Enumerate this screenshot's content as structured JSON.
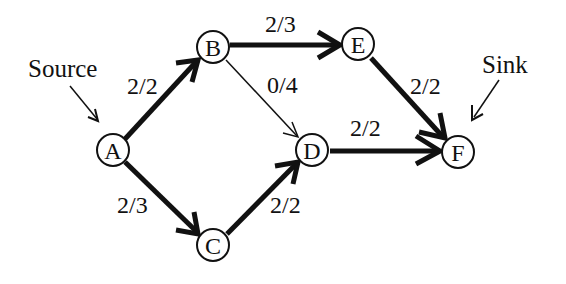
{
  "diagram": {
    "type": "flow-network",
    "nodes": [
      {
        "id": "A",
        "label": "A",
        "x": 113,
        "y": 150
      },
      {
        "id": "B",
        "label": "B",
        "x": 213,
        "y": 47
      },
      {
        "id": "C",
        "label": "C",
        "x": 213,
        "y": 245
      },
      {
        "id": "D",
        "label": "D",
        "x": 312,
        "y": 150
      },
      {
        "id": "E",
        "label": "E",
        "x": 358,
        "y": 44
      },
      {
        "id": "F",
        "label": "F",
        "x": 458,
        "y": 152
      }
    ],
    "edges": [
      {
        "from": "A",
        "to": "B",
        "label": "2/2",
        "saturated": true
      },
      {
        "from": "A",
        "to": "C",
        "label": "2/3",
        "saturated": false
      },
      {
        "from": "B",
        "to": "E",
        "label": "2/3",
        "saturated": false
      },
      {
        "from": "B",
        "to": "D",
        "label": "0/4",
        "saturated": false
      },
      {
        "from": "C",
        "to": "D",
        "label": "2/2",
        "saturated": true
      },
      {
        "from": "D",
        "to": "F",
        "label": "2/2",
        "saturated": true
      },
      {
        "from": "E",
        "to": "F",
        "label": "2/2",
        "saturated": true
      }
    ],
    "annotations": {
      "source": "Source",
      "sink": "Sink"
    }
  }
}
